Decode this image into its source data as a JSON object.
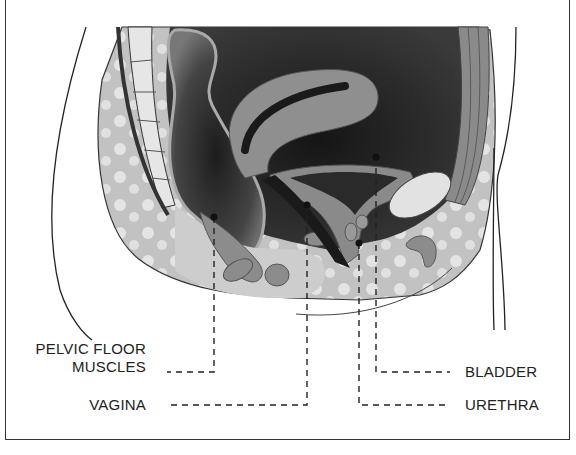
{
  "diagram": {
    "type": "anatomical cross-section",
    "labels": [
      {
        "id": "pelvic-floor-muscles",
        "line1": "PELVIC FLOOR",
        "line2": "MUSCLES",
        "side": "left"
      },
      {
        "id": "vagina",
        "text": "VAGINA",
        "side": "left"
      },
      {
        "id": "bladder",
        "text": "BLADDER",
        "side": "right"
      },
      {
        "id": "urethra",
        "text": "URETHRA",
        "side": "right"
      }
    ],
    "colors": {
      "outline": "#222222",
      "dark_cavity": "#1e1e1e",
      "mid_gray": "#7a7a7a",
      "light_gray": "#bdbdbd",
      "fat_tissue": "#cfcfcf",
      "bone": "#e2e2e2"
    }
  }
}
